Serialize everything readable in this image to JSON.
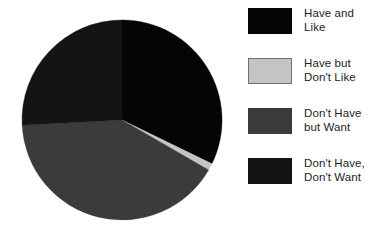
{
  "chart_data": {
    "type": "pie",
    "title": "",
    "subtitle": "",
    "xlabel": "",
    "ylabel": "",
    "grid": false,
    "legend_position": "right",
    "start_angle_deg": 0,
    "direction": "clockwise",
    "center": {
      "x": 122,
      "y": 120
    },
    "radius": 100,
    "categories": [
      "Have and Like",
      "Have but Don't Like",
      "Don't Have but Want",
      "Don't Have, Don't Want"
    ],
    "values": [
      32,
      1,
      41,
      26
    ],
    "value_unit": "percent",
    "slices": [
      {
        "label": "Have and Like",
        "value": 32,
        "start_angle_deg": 0,
        "end_angle_deg": 116,
        "color": "#050505"
      },
      {
        "label": "Have but Don't Like",
        "value": 1,
        "start_angle_deg": 116,
        "end_angle_deg": 120,
        "color": "#c4c4c4"
      },
      {
        "label": "Don't Have but Want",
        "value": 41,
        "start_angle_deg": 120,
        "end_angle_deg": 267,
        "color": "#3b3b3b"
      },
      {
        "label": "Don't Have, Don't Want",
        "value": 26,
        "start_angle_deg": 267,
        "end_angle_deg": 360,
        "color": "#141414"
      }
    ]
  },
  "legend": {
    "entries": [
      {
        "label": "Have and\nLike",
        "color": "#050505",
        "border": "#050505",
        "swatch_name": "legend-swatch-have-and-like"
      },
      {
        "label": "Have but\nDon't Like",
        "color": "#c4c4c4",
        "border": "#6f6f6f",
        "swatch_name": "legend-swatch-have-but-dont-like"
      },
      {
        "label": "Don't Have\nbut Want",
        "color": "#3b3b3b",
        "border": "#3b3b3b",
        "swatch_name": "legend-swatch-dont-have-but-want"
      },
      {
        "label": "Don't Have,\nDon't Want",
        "color": "#141414",
        "border": "#141414",
        "swatch_name": "legend-swatch-dont-have-dont-want"
      }
    ]
  },
  "colors": {
    "background": "#ffffff",
    "text": "#1d1d1d",
    "slice_have_and_like": "#050505",
    "slice_have_but_dont_like": "#c4c4c4",
    "slice_dont_have_but_want": "#3b3b3b",
    "slice_dont_have_dont_want": "#141414"
  }
}
